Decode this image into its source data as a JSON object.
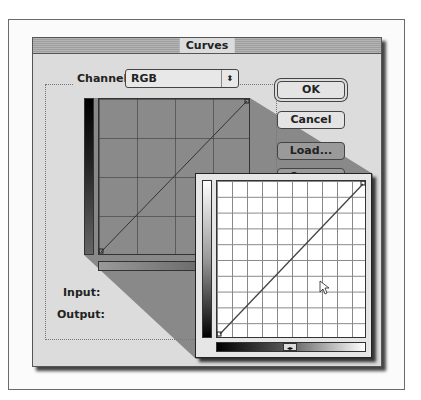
{
  "dialog": {
    "title": "Curves",
    "channel_label": "Channel:",
    "channel_value": "RGB",
    "input_label": "Input:",
    "output_label": "Output:",
    "buttons": {
      "ok": "OK",
      "cancel": "Cancel",
      "load": "Load...",
      "save": "Save..."
    }
  },
  "graph": {
    "grid_small": "4x4",
    "grid_zoomed": "10x10",
    "curve": "linear diagonal"
  },
  "icons": {
    "select_arrows": "⇕",
    "slider_knob": "◂▸"
  }
}
